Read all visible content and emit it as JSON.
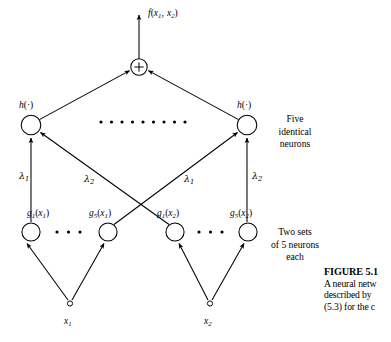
{
  "figure": {
    "output_label": "f(x1, x2)",
    "sum_symbol": "+",
    "hidden_layer": {
      "left_label": "h(·)",
      "right_label": "h(·)",
      "annotation": [
        "Five",
        "identical",
        "neurons"
      ],
      "ellipsis_dots": 10
    },
    "weights": {
      "left_vertical": "λ",
      "left_vertical_sub": "1",
      "left_cross": "λ",
      "left_cross_sub": "2",
      "right_cross": "λ",
      "right_cross_sub": "1",
      "right_vertical": "λ",
      "right_vertical_sub": "2"
    },
    "basis_layer": {
      "nodes": [
        {
          "name": "g",
          "sub": "1",
          "arg": "x",
          "arg_sub": "1"
        },
        {
          "name": "g",
          "sub": "5",
          "arg": "x",
          "arg_sub": "1"
        },
        {
          "name": "g",
          "sub": "1",
          "arg": "x",
          "arg_sub": "2"
        },
        {
          "name": "g",
          "sub": "5",
          "arg": "x",
          "arg_sub": "2"
        }
      ],
      "annotation": [
        "Two sets",
        "of 5 neurons",
        "each"
      ],
      "ellipsis_dots": 3
    },
    "inputs": [
      {
        "name": "x",
        "sub": "1"
      },
      {
        "name": "x",
        "sub": "2"
      }
    ]
  },
  "caption": {
    "title": "FIGURE 5.1",
    "lines": [
      "A neural netw",
      "described by ",
      "(5.3) for the c"
    ]
  },
  "colors": {
    "ink": "#000000",
    "background": "#ffffff"
  }
}
